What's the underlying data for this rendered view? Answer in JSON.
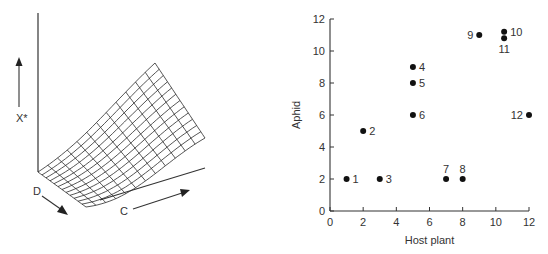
{
  "left_panel": {
    "type": "3d-surface",
    "labels": {
      "vertical_axis": "X*",
      "depth_axis": "D",
      "horizontal_axis": "C"
    },
    "grid": {
      "rows": 12,
      "cols": 12
    }
  },
  "chart_data": {
    "type": "scatter",
    "title": "",
    "xlabel": "Host plant",
    "ylabel": "Aphid",
    "xlim": [
      0,
      12
    ],
    "ylim": [
      0,
      12
    ],
    "xticks": [
      0,
      2,
      4,
      6,
      8,
      10,
      12
    ],
    "yticks": [
      0,
      2,
      4,
      6,
      8,
      10,
      12
    ],
    "grid": false,
    "legend": null,
    "points": [
      {
        "label": "1",
        "x": 1,
        "y": 2,
        "label_pos": "right"
      },
      {
        "label": "2",
        "x": 2,
        "y": 5,
        "label_pos": "right"
      },
      {
        "label": "3",
        "x": 3,
        "y": 2,
        "label_pos": "right"
      },
      {
        "label": "4",
        "x": 5,
        "y": 9,
        "label_pos": "right"
      },
      {
        "label": "5",
        "x": 5,
        "y": 8,
        "label_pos": "right"
      },
      {
        "label": "6",
        "x": 5,
        "y": 6,
        "label_pos": "right"
      },
      {
        "label": "7",
        "x": 7,
        "y": 2,
        "label_pos": "above"
      },
      {
        "label": "8",
        "x": 8,
        "y": 2,
        "label_pos": "above"
      },
      {
        "label": "9",
        "x": 9,
        "y": 11,
        "label_pos": "left"
      },
      {
        "label": "10",
        "x": 10.5,
        "y": 11.2,
        "label_pos": "right"
      },
      {
        "label": "11",
        "x": 10.5,
        "y": 10.8,
        "label_pos": "below"
      },
      {
        "label": "12",
        "x": 12,
        "y": 6,
        "label_pos": "left"
      }
    ]
  }
}
